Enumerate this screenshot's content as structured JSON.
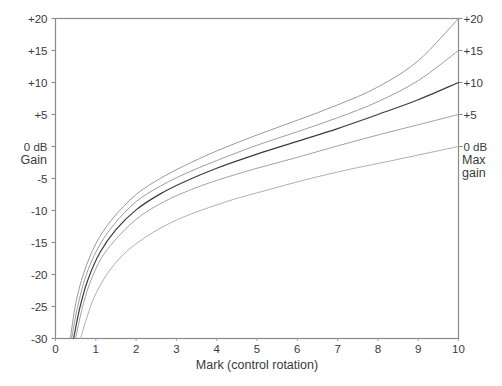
{
  "chart_data": {
    "type": "line",
    "title": "",
    "xlabel": "Mark  (control rotation)",
    "ylabel": "Gain",
    "ylabel_right": "Max gain",
    "ylabel_right_line1": "Max",
    "ylabel_right_line2": "gain",
    "zero_label_left": "0 dB",
    "zero_label_right": "0 dB",
    "xlim": [
      0,
      10
    ],
    "ylim": [
      -30,
      20
    ],
    "grid": false,
    "legend": "none",
    "x_ticks": [
      "0",
      "1",
      "2",
      "3",
      "4",
      "5",
      "6",
      "7",
      "8",
      "9",
      "10"
    ],
    "x_tick_values": [
      0,
      1,
      2,
      3,
      4,
      5,
      6,
      7,
      8,
      9,
      10
    ],
    "y_ticks_left": [
      "+20",
      "+15",
      "+10",
      "+5",
      "0 dB",
      "-5",
      "-10",
      "-15",
      "-20",
      "-25",
      "-30"
    ],
    "y_ticks_right": [
      "+20",
      "+15",
      "+10",
      "+5",
      "0 dB"
    ],
    "y_tick_values": [
      20,
      15,
      10,
      5,
      0,
      -5,
      -10,
      -15,
      -20,
      -25,
      -30
    ],
    "y_tick_values_right": [
      20,
      15,
      10,
      5,
      0
    ],
    "series": [
      {
        "name": "Max gain +20 dB",
        "end_value": 20,
        "color": "#9a9a9a",
        "width": 1.0,
        "x": [
          0.37,
          0.5,
          0.7,
          1.0,
          1.4,
          2.0,
          2.6,
          3.2,
          4.0,
          5.0,
          6.0,
          7.0,
          8.0,
          9.0,
          10.0
        ],
        "y": [
          -30.0,
          -24.6,
          -19.8,
          -15.2,
          -11.4,
          -7.5,
          -5.0,
          -3.0,
          -0.7,
          1.8,
          4.1,
          6.5,
          9.3,
          13.4,
          20.0
        ]
      },
      {
        "name": "Max gain +15 dB",
        "end_value": 15,
        "color": "#9e9e9e",
        "width": 1.0,
        "x": [
          0.4,
          0.55,
          0.75,
          1.05,
          1.45,
          2.0,
          2.6,
          3.2,
          4.0,
          5.0,
          6.0,
          7.0,
          8.0,
          9.0,
          10.0
        ],
        "y": [
          -30.0,
          -25.0,
          -20.3,
          -15.9,
          -12.2,
          -8.6,
          -6.2,
          -4.3,
          -2.2,
          0.2,
          2.3,
          4.5,
          7.0,
          10.3,
          15.0
        ]
      },
      {
        "name": "Max gain +10 dB",
        "end_value": 10,
        "color": "#3c3c3c",
        "width": 1.2,
        "x": [
          0.45,
          0.6,
          0.8,
          1.1,
          1.5,
          2.0,
          2.6,
          3.2,
          4.0,
          5.0,
          6.0,
          7.0,
          8.0,
          9.0,
          10.0
        ],
        "y": [
          -30.0,
          -25.3,
          -20.9,
          -16.6,
          -13.0,
          -9.9,
          -7.4,
          -5.5,
          -3.4,
          -1.2,
          0.8,
          2.8,
          5.0,
          7.3,
          10.0
        ]
      },
      {
        "name": "Max gain +5 dB",
        "end_value": 5,
        "color": "#a2a2a2",
        "width": 1.0,
        "x": [
          0.5,
          0.65,
          0.85,
          1.15,
          1.6,
          2.1,
          2.7,
          3.3,
          4.0,
          5.0,
          6.0,
          7.0,
          8.0,
          9.0,
          10.0
        ],
        "y": [
          -30.0,
          -25.6,
          -21.4,
          -17.3,
          -13.8,
          -10.9,
          -8.6,
          -6.9,
          -5.3,
          -3.4,
          -1.7,
          0.1,
          1.8,
          3.4,
          5.0
        ]
      },
      {
        "name": "Max gain 0 dB",
        "end_value": 0,
        "color": "#b0b0b0",
        "width": 1.0,
        "x": [
          0.62,
          0.8,
          1.0,
          1.35,
          1.8,
          2.4,
          3.0,
          3.6,
          4.4,
          5.2,
          6.2,
          7.2,
          8.2,
          9.1,
          10.0
        ],
        "y": [
          -30.0,
          -26.3,
          -23.0,
          -19.3,
          -16.2,
          -13.5,
          -11.5,
          -10.0,
          -8.3,
          -6.9,
          -5.2,
          -3.7,
          -2.4,
          -1.2,
          0.0
        ]
      }
    ]
  },
  "caption": {
    "text": ""
  },
  "colors": {
    "frame": "#8a8a8a",
    "text": "#3a3a3a",
    "background": "#ffffff",
    "highlight_curve": "#3c3c3c"
  }
}
